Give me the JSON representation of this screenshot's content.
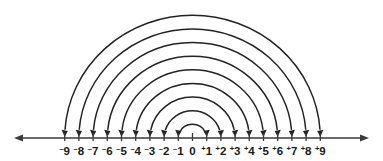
{
  "figure": {
    "background_color": "#ffffff",
    "line_color": "#3a3a3a",
    "arc_color": "#232323",
    "label_color": "#1a1a1a"
  },
  "number_line": {
    "min": -9,
    "max": 9,
    "step": 1,
    "left_arrow": true,
    "right_arrow": true,
    "ticks": [
      {
        "value": -9,
        "sign": "⁻",
        "digit": "9",
        "label": "⁻9"
      },
      {
        "value": -8,
        "sign": "⁻",
        "digit": "8",
        "label": "⁻8"
      },
      {
        "value": -7,
        "sign": "⁻",
        "digit": "7",
        "label": "⁻7"
      },
      {
        "value": -6,
        "sign": "⁻",
        "digit": "6",
        "label": "⁻6"
      },
      {
        "value": -5,
        "sign": "⁻",
        "digit": "5",
        "label": "⁻5"
      },
      {
        "value": -4,
        "sign": "⁻",
        "digit": "4",
        "label": "⁻4"
      },
      {
        "value": -3,
        "sign": "⁻",
        "digit": "3",
        "label": "⁻3"
      },
      {
        "value": -2,
        "sign": "⁻",
        "digit": "2",
        "label": "⁻2"
      },
      {
        "value": -1,
        "sign": "⁻",
        "digit": "1",
        "label": "⁻1"
      },
      {
        "value": 0,
        "sign": "",
        "digit": "0",
        "label": "0"
      },
      {
        "value": 1,
        "sign": "⁺",
        "digit": "1",
        "label": "⁺1"
      },
      {
        "value": 2,
        "sign": "⁺",
        "digit": "2",
        "label": "⁺2"
      },
      {
        "value": 3,
        "sign": "⁺",
        "digit": "3",
        "label": "⁺3"
      },
      {
        "value": 4,
        "sign": "⁺",
        "digit": "4",
        "label": "⁺4"
      },
      {
        "value": 5,
        "sign": "⁺",
        "digit": "5",
        "label": "⁺5"
      },
      {
        "value": 6,
        "sign": "⁺",
        "digit": "6",
        "label": "⁺6"
      },
      {
        "value": 7,
        "sign": "⁺",
        "digit": "7",
        "label": "⁺7"
      },
      {
        "value": 8,
        "sign": "⁺",
        "digit": "8",
        "label": "⁺8"
      },
      {
        "value": 9,
        "sign": "⁺",
        "digit": "9",
        "label": "⁺9"
      }
    ]
  },
  "arcs": [
    {
      "from": -1,
      "to": 1,
      "magnitude": 1
    },
    {
      "from": -2,
      "to": 2,
      "magnitude": 2
    },
    {
      "from": -3,
      "to": 3,
      "magnitude": 3
    },
    {
      "from": -4,
      "to": 4,
      "magnitude": 4
    },
    {
      "from": -5,
      "to": 5,
      "magnitude": 5
    },
    {
      "from": -6,
      "to": 6,
      "magnitude": 6
    },
    {
      "from": -7,
      "to": 7,
      "magnitude": 7
    },
    {
      "from": -8,
      "to": 8,
      "magnitude": 8
    },
    {
      "from": -9,
      "to": 9,
      "magnitude": 9
    }
  ],
  "geometry": {
    "origin_x": 192.5,
    "unit_px": 14.2,
    "axis_y": 138,
    "tick_top_offset": 5,
    "tick_bottom_offset": 3,
    "label_y": 155,
    "arc_vertical_scale": 0.96,
    "arrowhead": true
  }
}
